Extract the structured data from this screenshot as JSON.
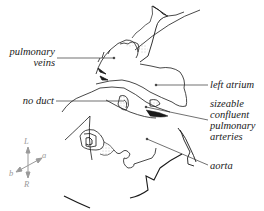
{
  "figure": {
    "type": "anatomical line drawing",
    "labels": {
      "pulmonary_veins": [
        "pulmonary",
        "veins"
      ],
      "no_duct": "no duct",
      "left_atrium": "left atrium",
      "sizeable_confluent_pulmonary_arteries": [
        "sizeable",
        "confluent",
        "pulmonary",
        "arteries"
      ],
      "aorta": "aorta"
    },
    "orientation_compass": {
      "top": "L",
      "bottom": "R",
      "upper_right": "a",
      "lower_left": "b"
    },
    "colors": {
      "line": "#1a1a1a",
      "leader_line": "#333333",
      "stipple": "#9a9a9a",
      "compass": "#9a9a9a"
    }
  }
}
